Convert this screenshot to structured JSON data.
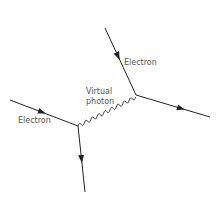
{
  "diagram": {
    "colors": {
      "line": "#222222",
      "label": "#555555",
      "background": "#ffffff"
    },
    "vertices": [
      {
        "id": "v1",
        "x": 78,
        "y": 126
      },
      {
        "id": "v2",
        "x": 136,
        "y": 95
      }
    ],
    "edges": [
      {
        "type": "fermion",
        "from": [
          10,
          100
        ],
        "to": [
          78,
          126
        ],
        "arrow": "forward"
      },
      {
        "type": "fermion",
        "from": [
          78,
          126
        ],
        "to": [
          85,
          192
        ],
        "arrow": "forward"
      },
      {
        "type": "fermion",
        "from": [
          105,
          28
        ],
        "to": [
          136,
          95
        ],
        "arrow": "forward"
      },
      {
        "type": "fermion",
        "from": [
          136,
          95
        ],
        "to": [
          210,
          117
        ],
        "arrow": "forward"
      },
      {
        "type": "photon",
        "from": [
          78,
          126
        ],
        "to": [
          136,
          95
        ]
      }
    ],
    "labels": {
      "electron_left": "Electron",
      "electron_top": "Electron",
      "photon_line1": "Virtual",
      "photon_line2": "photon"
    }
  }
}
